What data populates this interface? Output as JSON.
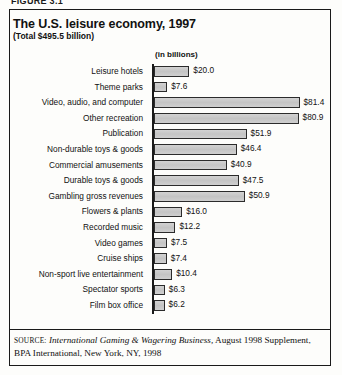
{
  "figure_caption": "FIGURE 3.1",
  "header": {
    "title": "The U.S. leisure economy, 1997",
    "subtitle": "(Total $495.5 billion)"
  },
  "column_header": "(in billions)",
  "source": {
    "label": "Source:",
    "publication": "International Gaming & Wagering Business,",
    "rest": " August 1998 Supplement, BPA International, New York, NY, 1998"
  },
  "chart_data": {
    "type": "bar",
    "orientation": "horizontal",
    "title": "The U.S. leisure economy, 1997",
    "subtitle": "(Total $495.5 billion)",
    "xlabel": "(in billions)",
    "ylabel": "",
    "units": "billions of US dollars",
    "total": 495.5,
    "grid": false,
    "legend": "none",
    "xlim": [
      0,
      81.4
    ],
    "categories": [
      "Leisure hotels",
      "Theme parks",
      "Video, audio, and computer",
      "Other recreation",
      "Publication",
      "Non-durable toys & goods",
      "Commercial amusements",
      "Durable toys & goods",
      "Gambling gross revenues",
      "Flowers & plants",
      "Recorded music",
      "Video games",
      "Cruise ships",
      "Non-sport live entertainment",
      "Spectator sports",
      "Film box office"
    ],
    "values": [
      20.0,
      7.6,
      81.4,
      80.9,
      51.9,
      46.4,
      40.9,
      47.5,
      50.9,
      16.0,
      12.2,
      7.5,
      7.4,
      10.4,
      6.3,
      6.2
    ],
    "data_labels": [
      "$20.0",
      "$7.6",
      "$81.4",
      "$80.9",
      "$51.9",
      "$46.4",
      "$40.9",
      "$47.5",
      "$50.9",
      "$16.0",
      "$12.2",
      "$7.5",
      "$7.4",
      "$10.4",
      "$6.3",
      "$6.2"
    ],
    "colors": {
      "bar_fill": "#c9c9c9",
      "bar_border": "#2b2b2b",
      "text": "#111111",
      "background": "#fdfdfb"
    }
  }
}
